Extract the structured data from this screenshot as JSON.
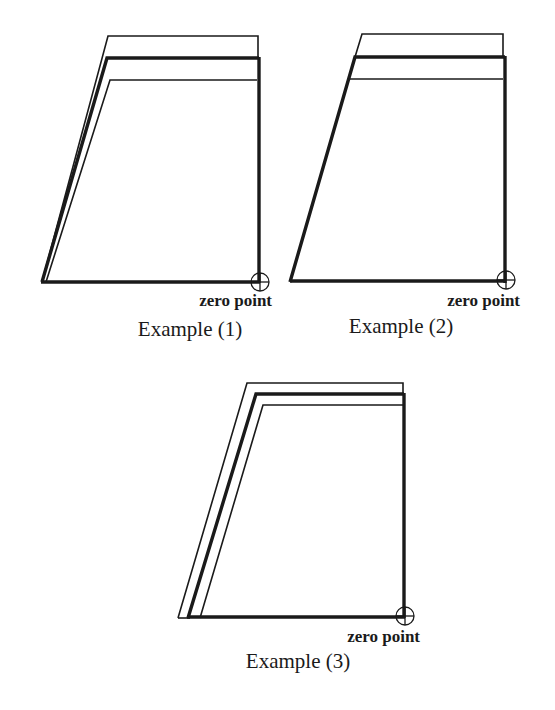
{
  "diagram": {
    "stroke_color": "#1a1a1a",
    "background": "#ffffff",
    "examples": [
      {
        "id": "example-1",
        "caption": "Example (1)",
        "zero_point_label": "zero point",
        "outer_line": {
          "top_y": 36,
          "top_left_x": 108,
          "right_x": 258
        },
        "thick_line": {
          "top_y": 58,
          "top_left_x": 107,
          "right_x": 259
        },
        "inner_line": {
          "top_y": 80,
          "top_left_x": 110,
          "right_x": 257
        },
        "bottom_y": 282,
        "bottom_left_x": 41,
        "zero_point": {
          "x": 260,
          "y": 282
        }
      },
      {
        "id": "example-2",
        "caption": "Example (2)",
        "zero_point_label": "zero point",
        "outer_line": {
          "top_y": 34,
          "top_left_x": 362,
          "right_x": 503
        },
        "thick_line": {
          "top_y": 57,
          "top_left_x": 355,
          "right_x": 505
        },
        "inner_line": {
          "top_y": 79,
          "top_left_x": 353,
          "right_x": 503
        },
        "bottom_y": 282,
        "bottom_left_x": 290,
        "zero_point": {
          "x": 506,
          "y": 279
        }
      },
      {
        "id": "example-3",
        "caption": "Example (3)",
        "zero_point_label": "zero point",
        "outer_line": {
          "top_y": 383,
          "top_left_x": 247,
          "right_x": 403
        },
        "thick_line": {
          "top_y": 394,
          "top_left_x": 256,
          "right_x": 404
        },
        "inner_line": {
          "top_y": 405,
          "top_left_x": 263,
          "right_x": 403
        },
        "bottom_y": 618,
        "bottom_left_x": 178,
        "zero_point": {
          "x": 405,
          "y": 615
        }
      }
    ]
  }
}
